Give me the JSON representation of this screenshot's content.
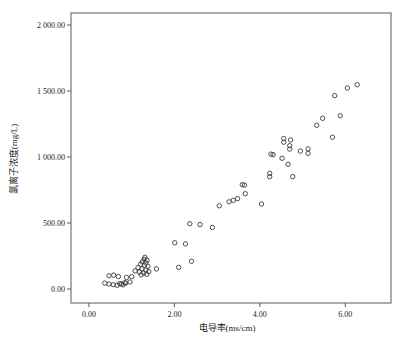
{
  "figure": {
    "background": "#ffffff"
  },
  "chart_data": {
    "type": "scatter",
    "title": "",
    "xlabel": "电导率(ms/cm)",
    "ylabel": "氯离子浓度(mg/L)",
    "x_ticks": [
      0,
      2,
      4,
      6
    ],
    "x_tick_labels": [
      "0.00",
      "2.00",
      "4.00",
      "6.00"
    ],
    "y_ticks": [
      0,
      500,
      1000,
      1500,
      2000
    ],
    "y_tick_labels": [
      "0.00",
      "500.00",
      "1 000.00",
      "1 500.00",
      "2 000.00"
    ],
    "xlim": [
      -0.42,
      7.07
    ],
    "ylim": [
      -106,
      2091
    ],
    "grid": false,
    "frame": true,
    "marker": "open-circle",
    "marker_color": "#3c3c3c",
    "axis_color": "#5a5a5a",
    "text_color": "#1a1a1a",
    "points": [
      [
        0.37,
        45
      ],
      [
        0.47,
        38
      ],
      [
        0.57,
        33
      ],
      [
        0.66,
        28
      ],
      [
        0.76,
        38
      ],
      [
        0.86,
        45
      ],
      [
        0.96,
        53
      ],
      [
        0.72,
        40
      ],
      [
        0.8,
        32
      ],
      [
        0.84,
        48
      ],
      [
        0.47,
        100
      ],
      [
        0.58,
        105
      ],
      [
        0.69,
        95
      ],
      [
        0.88,
        88
      ],
      [
        1.0,
        93
      ],
      [
        1.29,
        225
      ],
      [
        1.36,
        218
      ],
      [
        1.31,
        240
      ],
      [
        1.25,
        205
      ],
      [
        1.33,
        198
      ],
      [
        1.21,
        188
      ],
      [
        1.3,
        180
      ],
      [
        1.38,
        172
      ],
      [
        1.15,
        162
      ],
      [
        1.24,
        152
      ],
      [
        1.33,
        143
      ],
      [
        1.4,
        132
      ],
      [
        1.28,
        122
      ],
      [
        1.18,
        128
      ],
      [
        1.08,
        137
      ],
      [
        1.35,
        112
      ],
      [
        1.22,
        108
      ],
      [
        1.58,
        152
      ],
      [
        2.01,
        350
      ],
      [
        2.26,
        342
      ],
      [
        2.1,
        164
      ],
      [
        2.4,
        210
      ],
      [
        2.36,
        495
      ],
      [
        2.6,
        488
      ],
      [
        2.89,
        467
      ],
      [
        3.05,
        630
      ],
      [
        3.28,
        661
      ],
      [
        3.38,
        672
      ],
      [
        3.48,
        685
      ],
      [
        3.59,
        790
      ],
      [
        3.64,
        787
      ],
      [
        3.66,
        722
      ],
      [
        4.04,
        644
      ],
      [
        4.23,
        876
      ],
      [
        4.23,
        851
      ],
      [
        4.77,
        851
      ],
      [
        4.26,
        1022
      ],
      [
        4.31,
        1018
      ],
      [
        4.52,
        990
      ],
      [
        4.66,
        945
      ],
      [
        4.56,
        1140
      ],
      [
        4.56,
        1112
      ],
      [
        4.72,
        1130
      ],
      [
        4.7,
        1086
      ],
      [
        4.7,
        1060
      ],
      [
        4.95,
        1045
      ],
      [
        5.13,
        1062
      ],
      [
        5.13,
        1028
      ],
      [
        5.7,
        1150
      ],
      [
        5.33,
        1240
      ],
      [
        5.47,
        1293
      ],
      [
        5.88,
        1313
      ],
      [
        5.75,
        1465
      ],
      [
        6.05,
        1523
      ],
      [
        6.28,
        1548
      ]
    ]
  }
}
